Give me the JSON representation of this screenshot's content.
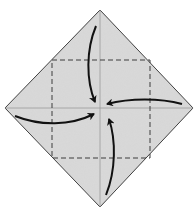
{
  "diagram": {
    "title": "",
    "type": "origami-fold-diagram",
    "fold": "blintz fold - four corners to center",
    "colors": {
      "paper": "#d6d6d6",
      "outline": "#3a3a3a",
      "crease": "#9a9a9a",
      "dashed": "#3c3c3c",
      "arrow": "#111111"
    },
    "square_corners": {
      "top": [
        100,
        10
      ],
      "right": [
        193,
        108
      ],
      "bottom": [
        100,
        207
      ],
      "left": [
        5,
        108
      ]
    },
    "fold_lines": {
      "style": "dashed",
      "box": [
        52,
        60,
        150,
        158
      ]
    },
    "arrows": [
      {
        "id": "top",
        "from": "top corner",
        "to": "center"
      },
      {
        "id": "right",
        "from": "right corner",
        "to": "center"
      },
      {
        "id": "bottom",
        "from": "bottom corner",
        "to": "center"
      },
      {
        "id": "left",
        "from": "left corner",
        "to": "center"
      }
    ]
  }
}
